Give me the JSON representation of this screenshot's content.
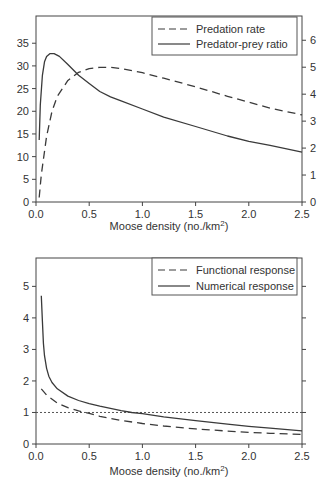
{
  "chart_data": [
    {
      "type": "line",
      "panel": "top",
      "title": "",
      "xlabel": "Moose density (no./km²)",
      "ylabel": "",
      "y2label": "",
      "xlim": [
        0,
        2.5
      ],
      "ylim": [
        0,
        41
      ],
      "y2lim": [
        0,
        6.9
      ],
      "xticks": [
        0.0,
        0.5,
        1.0,
        1.5,
        2.0,
        2.5
      ],
      "xtick_labels": [
        "0.0",
        "0.5",
        "1.0",
        "1.5",
        "2.0",
        "2.5"
      ],
      "yticks": [
        0,
        5,
        10,
        15,
        20,
        25,
        30,
        35
      ],
      "y2ticks": [
        0,
        1,
        2,
        3,
        4,
        5,
        6
      ],
      "grid": false,
      "legend_position": "upper right",
      "series": [
        {
          "name": "Predation rate",
          "style": "dashed",
          "axis": "left",
          "x": [
            0.03,
            0.05,
            0.1,
            0.15,
            0.2,
            0.3,
            0.4,
            0.5,
            0.6,
            0.7,
            0.8,
            1.0,
            1.2,
            1.5,
            1.8,
            2.0,
            2.2,
            2.5
          ],
          "y": [
            1.0,
            6.0,
            14.5,
            20.0,
            23.3,
            26.8,
            28.6,
            29.4,
            29.7,
            29.7,
            29.4,
            28.5,
            27.3,
            25.4,
            23.3,
            22.0,
            20.7,
            19.2
          ]
        },
        {
          "name": "Predator-prey ratio",
          "style": "solid",
          "axis": "right",
          "x": [
            0.03,
            0.04,
            0.06,
            0.08,
            0.1,
            0.13,
            0.17,
            0.22,
            0.3,
            0.4,
            0.5,
            0.6,
            0.7,
            0.8,
            1.0,
            1.2,
            1.5,
            1.8,
            2.0,
            2.2,
            2.5
          ],
          "y": [
            2.3,
            3.6,
            4.7,
            5.2,
            5.4,
            5.5,
            5.5,
            5.4,
            5.1,
            4.7,
            4.4,
            4.1,
            3.9,
            3.75,
            3.45,
            3.15,
            2.8,
            2.45,
            2.25,
            2.1,
            1.85
          ]
        }
      ]
    },
    {
      "type": "line",
      "panel": "bottom",
      "title": "",
      "xlabel": "Moose density (no./km²)",
      "ylabel": "",
      "xlim": [
        0,
        2.5
      ],
      "ylim": [
        0,
        5.9
      ],
      "xticks": [
        0.0,
        0.5,
        1.0,
        1.5,
        2.0,
        2.5
      ],
      "xtick_labels": [
        "0.0",
        "0.5",
        "1.0",
        "1.5",
        "2.0",
        "2.5"
      ],
      "yticks": [
        0,
        1,
        2,
        3,
        4,
        5
      ],
      "y2ticks_unlabeled": [
        0,
        1,
        2,
        3,
        4,
        5
      ],
      "grid": false,
      "legend_position": "upper right",
      "reference_line": {
        "y": 1.0,
        "style": "dotted"
      },
      "series": [
        {
          "name": "Functional response",
          "style": "dashed",
          "x": [
            0.05,
            0.1,
            0.2,
            0.3,
            0.4,
            0.5,
            0.6,
            0.8,
            1.0,
            1.2,
            1.5,
            1.8,
            2.0,
            2.2,
            2.5
          ],
          "y": [
            1.75,
            1.55,
            1.3,
            1.15,
            1.05,
            0.97,
            0.88,
            0.75,
            0.65,
            0.57,
            0.48,
            0.41,
            0.37,
            0.34,
            0.3
          ]
        },
        {
          "name": "Numerical response",
          "style": "solid",
          "x": [
            0.05,
            0.06,
            0.07,
            0.08,
            0.1,
            0.12,
            0.15,
            0.2,
            0.3,
            0.4,
            0.5,
            0.6,
            0.8,
            0.9,
            1.0,
            1.2,
            1.5,
            1.8,
            2.0,
            2.2,
            2.5
          ],
          "y": [
            4.7,
            3.9,
            3.2,
            2.8,
            2.4,
            2.15,
            1.95,
            1.75,
            1.52,
            1.38,
            1.28,
            1.2,
            1.06,
            1.0,
            0.96,
            0.86,
            0.74,
            0.63,
            0.56,
            0.5,
            0.42
          ]
        }
      ]
    }
  ],
  "panels": {
    "top": {
      "legend": [
        "Predation rate",
        "Predator-prey ratio"
      ],
      "x_axis_title": "Moose density (no./km",
      "x_axis_title_sup": "2",
      "x_axis_title_end": ")"
    },
    "bottom": {
      "legend": [
        "Functional response",
        "Numerical response"
      ],
      "x_axis_title": "Moose density (no./km",
      "x_axis_title_sup": "2",
      "x_axis_title_end": ")"
    }
  },
  "colors": {
    "axis": "#444444",
    "line": "#3a3a3a",
    "text": "#333333",
    "reference": "#555555"
  }
}
